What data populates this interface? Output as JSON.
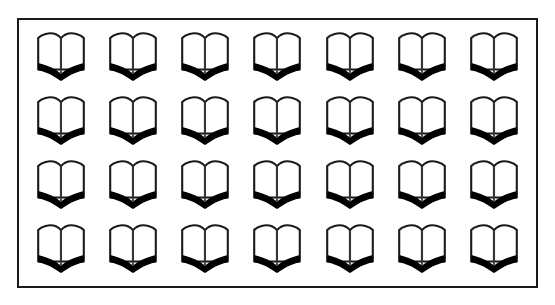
{
  "page": {
    "background_color": "#ffffff",
    "width": 555,
    "height": 305
  },
  "frame": {
    "border_color": "#1a1a1a",
    "border_width": 2,
    "fill_color": "#ffffff"
  },
  "grid": {
    "columns": 7,
    "rows": 4,
    "total_icons": 28,
    "icon_name": "open-book-icon",
    "icon_label": "open book",
    "icon_outline_color": "#1a1a1a",
    "icon_fill_color": "#ffffff",
    "icon_accent_color": "#000000",
    "cells": [
      {
        "row": 1,
        "col": 1,
        "icon": "open-book-icon"
      },
      {
        "row": 1,
        "col": 2,
        "icon": "open-book-icon"
      },
      {
        "row": 1,
        "col": 3,
        "icon": "open-book-icon"
      },
      {
        "row": 1,
        "col": 4,
        "icon": "open-book-icon"
      },
      {
        "row": 1,
        "col": 5,
        "icon": "open-book-icon"
      },
      {
        "row": 1,
        "col": 6,
        "icon": "open-book-icon"
      },
      {
        "row": 1,
        "col": 7,
        "icon": "open-book-icon"
      },
      {
        "row": 2,
        "col": 1,
        "icon": "open-book-icon"
      },
      {
        "row": 2,
        "col": 2,
        "icon": "open-book-icon"
      },
      {
        "row": 2,
        "col": 3,
        "icon": "open-book-icon"
      },
      {
        "row": 2,
        "col": 4,
        "icon": "open-book-icon"
      },
      {
        "row": 2,
        "col": 5,
        "icon": "open-book-icon"
      },
      {
        "row": 2,
        "col": 6,
        "icon": "open-book-icon"
      },
      {
        "row": 2,
        "col": 7,
        "icon": "open-book-icon"
      },
      {
        "row": 3,
        "col": 1,
        "icon": "open-book-icon"
      },
      {
        "row": 3,
        "col": 2,
        "icon": "open-book-icon"
      },
      {
        "row": 3,
        "col": 3,
        "icon": "open-book-icon"
      },
      {
        "row": 3,
        "col": 4,
        "icon": "open-book-icon"
      },
      {
        "row": 3,
        "col": 5,
        "icon": "open-book-icon"
      },
      {
        "row": 3,
        "col": 6,
        "icon": "open-book-icon"
      },
      {
        "row": 3,
        "col": 7,
        "icon": "open-book-icon"
      },
      {
        "row": 4,
        "col": 1,
        "icon": "open-book-icon"
      },
      {
        "row": 4,
        "col": 2,
        "icon": "open-book-icon"
      },
      {
        "row": 4,
        "col": 3,
        "icon": "open-book-icon"
      },
      {
        "row": 4,
        "col": 4,
        "icon": "open-book-icon"
      },
      {
        "row": 4,
        "col": 5,
        "icon": "open-book-icon"
      },
      {
        "row": 4,
        "col": 6,
        "icon": "open-book-icon"
      },
      {
        "row": 4,
        "col": 7,
        "icon": "open-book-icon"
      }
    ]
  }
}
